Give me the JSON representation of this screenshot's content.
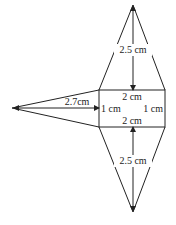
{
  "diagram": {
    "type": "net of square-based pyramid (rectangle with triangles)",
    "rectangle": {
      "top_label": "2 cm",
      "bottom_label": "2 cm",
      "left_label": "1 cm",
      "right_label": "1 cm"
    },
    "top_triangle": {
      "height_label": "2.5 cm"
    },
    "bottom_triangle": {
      "height_label": "2.5 cm"
    },
    "left_triangle": {
      "height_label": "2.7cm"
    },
    "colors": {
      "stroke": "#222222",
      "background": "#ffffff"
    }
  }
}
